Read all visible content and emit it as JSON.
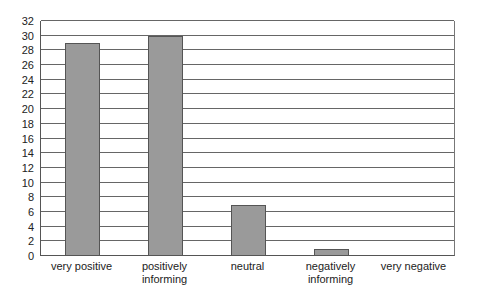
{
  "chart_data": {
    "type": "bar",
    "title": "",
    "xlabel": "",
    "ylabel": "",
    "categories": [
      "very positive",
      "positively informing",
      "neutral",
      "negatively informing",
      "very negative"
    ],
    "category_lines": [
      [
        "very positive"
      ],
      [
        "positively",
        "informing"
      ],
      [
        "neutral"
      ],
      [
        "negatively",
        "informing"
      ],
      [
        "very negative"
      ]
    ],
    "values": [
      29,
      30,
      7,
      1,
      0
    ],
    "ylim": [
      0,
      32
    ],
    "yticks": [
      0,
      2,
      4,
      6,
      8,
      10,
      12,
      14,
      16,
      18,
      20,
      22,
      24,
      26,
      28,
      30,
      32
    ],
    "grid": true,
    "legend": null,
    "bar_color": "#9a9a9a"
  }
}
